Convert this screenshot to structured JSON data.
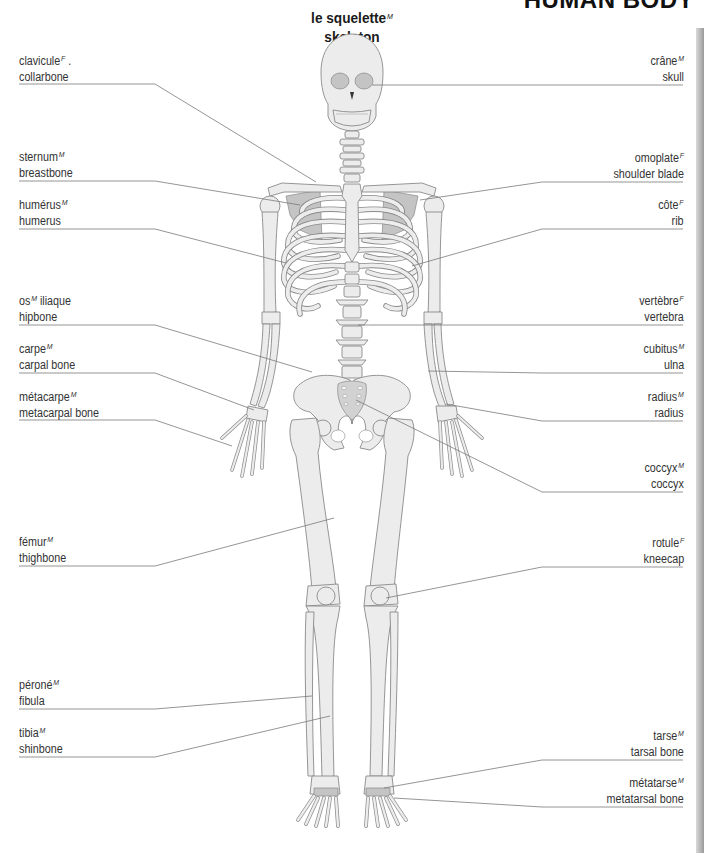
{
  "header": {
    "section_title": "HUMAN BODY"
  },
  "diagram": {
    "title_fr": "le squelette",
    "title_fr_gender": "M",
    "title_en": "skeleton"
  },
  "labels": {
    "left": [
      {
        "fr": "clavicule",
        "gender": "F",
        "en": "collarbone",
        "extra": "."
      },
      {
        "fr": "sternum",
        "gender": "M",
        "en": "breastbone"
      },
      {
        "fr": "humérus",
        "gender": "M",
        "en": "humerus"
      },
      {
        "fr": "os",
        "gender": "M",
        "fr_after": " iliaque",
        "en": "hipbone"
      },
      {
        "fr": "carpe",
        "gender": "M",
        "en": "carpal bone"
      },
      {
        "fr": "métacarpe",
        "gender": "M",
        "en": "metacarpal bone"
      },
      {
        "fr": "fémur",
        "gender": "M",
        "en": "thighbone"
      },
      {
        "fr": "péroné",
        "gender": "M",
        "en": "fibula"
      },
      {
        "fr": "tibia",
        "gender": "M",
        "en": "shinbone"
      }
    ],
    "right": [
      {
        "fr": "crâne",
        "gender": "M",
        "en": "skull"
      },
      {
        "fr": "omoplate",
        "gender": "F",
        "en": "shoulder blade"
      },
      {
        "fr": "côte",
        "gender": "F",
        "en": "rib"
      },
      {
        "fr": "vertèbre",
        "gender": "F",
        "en": "vertebra"
      },
      {
        "fr": "cubitus",
        "gender": "M",
        "en": "ulna"
      },
      {
        "fr": "radius",
        "gender": "M",
        "en": "radius"
      },
      {
        "fr": "coccyx",
        "gender": "M",
        "en": "coccyx"
      },
      {
        "fr": "rotule",
        "gender": "F",
        "en": "kneecap"
      },
      {
        "fr": "tarse",
        "gender": "M",
        "en": "tarsal bone"
      },
      {
        "fr": "métatarse",
        "gender": "M",
        "en": "metatarsal bone"
      }
    ]
  },
  "colors": {
    "bone_fill": "#ececec",
    "bone_stroke": "#8a8a8a",
    "shadow_fill": "#bdbdbd",
    "leader_line": "#7a7a7a",
    "text": "#333333"
  }
}
